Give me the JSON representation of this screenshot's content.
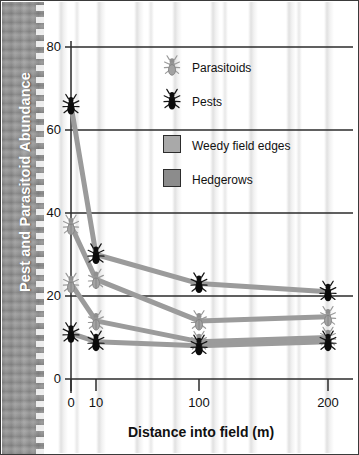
{
  "chart_data": {
    "type": "line",
    "title": "",
    "xlabel": "Distance into field (m)",
    "ylabel": "Pest and Parasitoid Abundance",
    "x": [
      0,
      10,
      100,
      200
    ],
    "xtick_labels": [
      "0",
      "10",
      "100",
      "200"
    ],
    "ytick_labels": [
      "0",
      "20",
      "40",
      "60",
      "80"
    ],
    "yticks": [
      0,
      20,
      40,
      60,
      80
    ],
    "ylim": [
      0,
      84
    ],
    "grid": "horizontal",
    "legend_position": "inside-top-right",
    "series": [
      {
        "name": "Pests in hedgerows",
        "organism": "Pests",
        "habitat": "Hedgerows",
        "marker": "black-beetle",
        "values": [
          66,
          30,
          23,
          21
        ]
      },
      {
        "name": "Parasitoids in weedy field edges",
        "organism": "Parasitoids",
        "habitat": "Weedy field edges",
        "marker": "gray-beetle",
        "values": [
          37,
          24,
          14,
          15
        ]
      },
      {
        "name": "Parasitoids in hedgerows",
        "organism": "Parasitoids",
        "habitat": "Hedgerows",
        "marker": "gray-beetle",
        "values": [
          23,
          14,
          9,
          10
        ]
      },
      {
        "name": "Pests in weedy field edges",
        "organism": "Pests",
        "habitat": "Weedy field edges",
        "marker": "black-beetle",
        "values": [
          11,
          9,
          8,
          9
        ]
      }
    ],
    "legend": [
      {
        "label": "Parasitoids",
        "icon": "gray-beetle-icon"
      },
      {
        "label": "Pests",
        "icon": "black-beetle-icon"
      },
      {
        "label": "Weedy field edges",
        "icon": "light-gray-swatch"
      },
      {
        "label": "Hedgerows",
        "icon": "dark-gray-swatch"
      }
    ],
    "colors": {
      "line": "#9b9b9b",
      "axis": "#2b2b2b",
      "pest_marker": "#101010",
      "parasitoid_marker": "#9a9a9a",
      "weedy_swatch": "#a9a9a9",
      "hedgerow_swatch": "#8c8c8c",
      "ytitle_band": "#939393",
      "ytitle_text": "#ffffff"
    }
  }
}
